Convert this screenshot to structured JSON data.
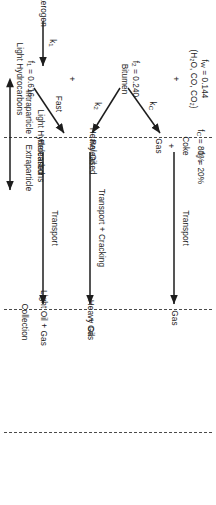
{
  "diagram": {
    "orientation_deg": 90,
    "stroke_color": "#1d1d1d",
    "dash_color": "#4a4a4a",
    "zones": [
      {
        "id": "intraparticle",
        "label": "Intraparticle"
      },
      {
        "id": "extraparticle",
        "label": "Extraparticle"
      },
      {
        "id": "collection",
        "label": "Collection"
      }
    ],
    "feed": {
      "label": "Kerogen",
      "rate_constant": "k",
      "rate_constant_sub": "1"
    },
    "products": [
      {
        "id": "light-hydrocarbons",
        "label": "Light Hydrocarbons",
        "fraction_symbol": "f",
        "fraction_sub": "1",
        "fraction_value": "f_1 = 0.616",
        "fraction_text": " = 0.616"
      },
      {
        "id": "bitumen",
        "label": "Bitumen",
        "fraction_symbol": "f",
        "fraction_sub": "2",
        "fraction_value": "f_2 = 0.240",
        "fraction_text": " = 0.240"
      },
      {
        "id": "water-gases",
        "label": "(H₂O, CO, CO₂)",
        "fraction_symbol": "f",
        "fraction_sub": "W",
        "fraction_value": "f_W = 0.144",
        "fraction_text": " = 0.144"
      }
    ],
    "plus_signs": [
      "+",
      "+",
      "+"
    ],
    "reactions": [
      {
        "id": "fast-release",
        "label": "Fast",
        "from": "Light Hydrocarbons",
        "to": "Light Hydrocarbons Released"
      },
      {
        "id": "coke-route",
        "label": "k",
        "label_sub": "C",
        "from": "Bitumen",
        "to": "Coke + Gas"
      },
      {
        "id": "heavy-oil-route",
        "label": "k",
        "label_sub": "2",
        "from": "Bitumen",
        "to": "Heavy Oil Released"
      }
    ],
    "intermediates": [
      {
        "id": "coke",
        "label": "Coke",
        "split_symbol": "f",
        "split_sub": "C",
        "split_text": " = 80%"
      },
      {
        "id": "gas",
        "label": "Gas",
        "split_symbol": "f",
        "split_sub": "g",
        "split_text": " = 20%"
      },
      {
        "id": "heavy-oil-released",
        "line1": "Heavy Oil",
        "line2": "Released"
      },
      {
        "id": "light-hydrocarbons-released",
        "line1": "Light Hydrocarbons",
        "line2": "Released"
      }
    ],
    "transport_steps": [
      {
        "id": "gas-transport",
        "label": "Transport",
        "product": "Gas"
      },
      {
        "id": "heavy-oil-transport",
        "label": "Transport + Cracking",
        "product_line1": "Heavy Oil",
        "product_line2": "+ Gas"
      },
      {
        "id": "light-oil-transport",
        "label": "Transport",
        "product": "Light Oil + Gas"
      }
    ],
    "middle_plus": "+"
  }
}
